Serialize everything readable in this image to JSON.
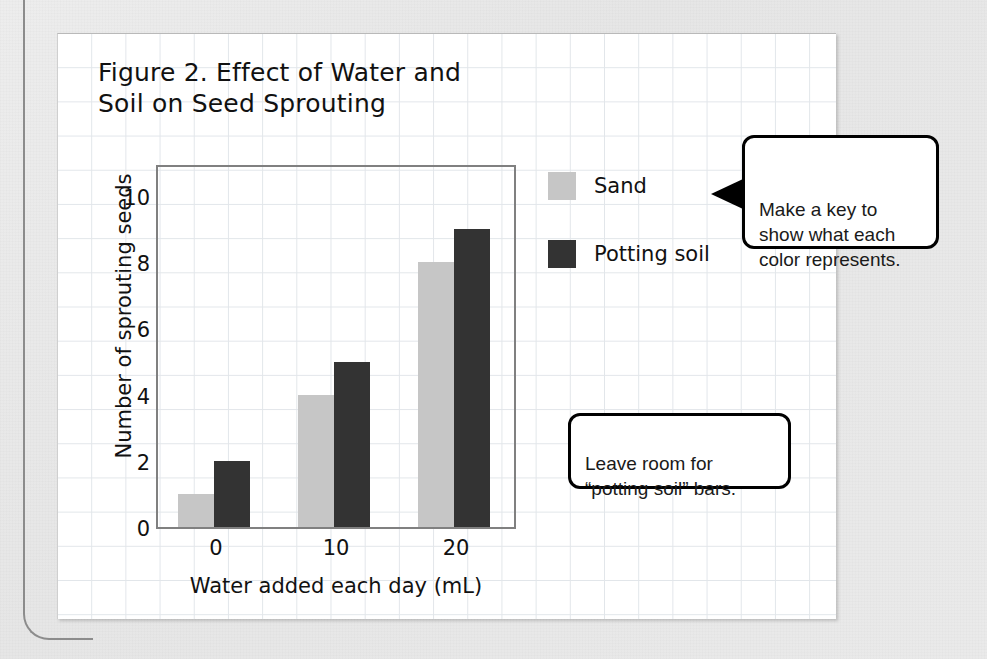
{
  "figure": {
    "title": "Figure 2. Effect of Water and\nSoil on Seed Sprouting"
  },
  "chart_data": {
    "type": "bar",
    "title": "Figure 2. Effect of Water and Soil on Seed Sprouting",
    "categories": [
      "0",
      "10",
      "20"
    ],
    "series": [
      {
        "name": "Sand",
        "values": [
          1,
          4,
          8
        ],
        "color": "#c6c6c6"
      },
      {
        "name": "Potting soil",
        "values": [
          2,
          5,
          9
        ],
        "color": "#333333"
      }
    ],
    "xlabel": "Water added each day (mL)",
    "ylabel": "Number of sprouting seeds",
    "ylim": [
      0,
      11
    ],
    "yticks": [
      0,
      2,
      4,
      6,
      8,
      10
    ],
    "ytick_labels": [
      "0",
      "2",
      "4",
      "6",
      "8",
      "10"
    ],
    "xtick_labels": [
      "0",
      "10",
      "20"
    ],
    "grid": false,
    "legend_position": "right"
  },
  "legend": {
    "items": [
      {
        "label": "Sand",
        "color": "#c6c6c6"
      },
      {
        "label": "Potting soil",
        "color": "#333333"
      }
    ]
  },
  "callouts": [
    {
      "id": "key",
      "text": "Make a key to\nshow what each\ncolor represents."
    },
    {
      "id": "room",
      "text": "Leave room for\n“potting soil” bars."
    }
  ],
  "colors": {
    "sand": "#c6c6c6",
    "potting_soil": "#333333",
    "grid_line": "#e2e6ea",
    "axis": "#808080",
    "page_background": "#e9e9e9",
    "panel_background": "#ffffff"
  }
}
